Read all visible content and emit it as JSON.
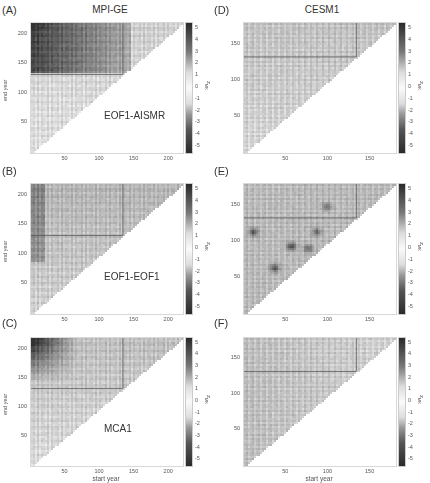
{
  "chart_data": [
    {
      "id": "A",
      "type": "heatmap",
      "panel_label": "(A)",
      "column_title": "MPI-GE",
      "annotation": "EOF1-AISMR",
      "xlabel": "",
      "ylabel": "end year",
      "xticks": [
        50,
        100,
        150,
        200
      ],
      "yticks": [
        50,
        100,
        150,
        200
      ],
      "xlim": [
        1,
        220
      ],
      "ylim": [
        1,
        220
      ],
      "colorbar_label": "z_MK",
      "colorbar_ticks": [
        5,
        4,
        3,
        2,
        1,
        0,
        -1,
        -2,
        -3,
        -4,
        -5
      ],
      "clim": [
        -6,
        6
      ],
      "shape": "upper-left triangle (end year > start year)",
      "reference_lines": {
        "x": 133,
        "y": 133
      },
      "description": "Strong dark (high |z|) region for end years > ~140 and start years < ~100"
    },
    {
      "id": "B",
      "type": "heatmap",
      "panel_label": "(B)",
      "annotation": "EOF1-EOF1",
      "xlabel": "",
      "ylabel": "end year",
      "xticks": [
        50,
        100,
        150,
        200
      ],
      "yticks": [
        50,
        100,
        150,
        200
      ],
      "xlim": [
        1,
        220
      ],
      "ylim": [
        1,
        220
      ],
      "colorbar_label": "z_MK",
      "colorbar_ticks": [
        5,
        4,
        3,
        2,
        1,
        0,
        -1,
        -2,
        -3,
        -4,
        -5
      ],
      "clim": [
        -6,
        6
      ],
      "shape": "upper-left triangle",
      "reference_lines": {
        "x": 133,
        "y": 133
      },
      "description": "Mostly light gray, moderate values near start year ~10 and end years 100-130"
    },
    {
      "id": "C",
      "type": "heatmap",
      "panel_label": "(C)",
      "annotation": "MCA1",
      "xlabel": "start year",
      "ylabel": "end year",
      "xticks": [
        50,
        100,
        150,
        200
      ],
      "yticks": [
        50,
        100,
        150,
        200
      ],
      "xlim": [
        1,
        220
      ],
      "ylim": [
        1,
        220
      ],
      "colorbar_label": "z_MK",
      "colorbar_ticks": [
        5,
        4,
        3,
        2,
        1,
        0,
        -1,
        -2,
        -3,
        -4,
        -5
      ],
      "clim": [
        -6,
        6
      ],
      "shape": "upper-left triangle",
      "reference_lines": {
        "x": 133,
        "y": 133
      },
      "description": "Dark region for end years > ~150 and start years < ~50"
    },
    {
      "id": "D",
      "type": "heatmap",
      "panel_label": "(D)",
      "column_title": "CESM1",
      "xlabel": "",
      "ylabel": "",
      "xticks": [
        50,
        100,
        150
      ],
      "yticks": [
        50,
        100,
        150
      ],
      "xlim": [
        1,
        180
      ],
      "ylim": [
        1,
        180
      ],
      "colorbar_label": "z_MK",
      "colorbar_ticks": [
        5,
        4,
        3,
        2,
        1,
        0,
        -1,
        -2,
        -3,
        -4,
        -5
      ],
      "clim": [
        -6,
        6
      ],
      "shape": "upper-left triangle",
      "reference_lines": {
        "x": 133,
        "y": 133
      },
      "description": "Mostly light, weak values throughout"
    },
    {
      "id": "E",
      "type": "heatmap",
      "panel_label": "(E)",
      "xlabel": "",
      "ylabel": "",
      "xticks": [
        50,
        100,
        150
      ],
      "yticks": [
        50,
        100,
        150
      ],
      "xlim": [
        1,
        180
      ],
      "ylim": [
        1,
        180
      ],
      "colorbar_label": "z_MK",
      "colorbar_ticks": [
        5,
        4,
        3,
        2,
        1,
        0,
        -1,
        -2,
        -3,
        -4,
        -5
      ],
      "clim": [
        -6,
        6
      ],
      "shape": "upper-left triangle",
      "reference_lines": {
        "x": 133,
        "y": 133
      },
      "description": "Medium-gray background with localized dark spots near (10,115),(55,95),(35,65),(85,115)"
    },
    {
      "id": "F",
      "type": "heatmap",
      "panel_label": "(F)",
      "xlabel": "start year",
      "ylabel": "",
      "xticks": [
        50,
        100,
        150
      ],
      "yticks": [
        50,
        100,
        150
      ],
      "xlim": [
        1,
        180
      ],
      "ylim": [
        1,
        180
      ],
      "colorbar_label": "z_MK",
      "colorbar_ticks": [
        5,
        4,
        3,
        2,
        1,
        0,
        -1,
        -2,
        -3,
        -4,
        -5
      ],
      "clim": [
        -6,
        6
      ],
      "shape": "upper-left triangle",
      "reference_lines": {
        "x": 133,
        "y": 133
      },
      "description": "Mostly light gray with faint striping"
    }
  ],
  "labels": {
    "col_left_title": "MPI-GE",
    "col_right_title": "CESM1",
    "y_axis_label": "end year",
    "x_axis_label": "start year",
    "colorbar_label": "z",
    "colorbar_sub": "MK"
  },
  "panels": [
    {
      "letter": "(A)",
      "annotation": "EOF1-AISMR",
      "xt": [
        "50",
        "100",
        "150",
        "200"
      ],
      "yt": [
        "200",
        "150",
        "100",
        "50"
      ]
    },
    {
      "letter": "(B)",
      "annotation": "EOF1-EOF1",
      "xt": [
        "50",
        "100",
        "150",
        "200"
      ],
      "yt": [
        "200",
        "150",
        "100",
        "50"
      ]
    },
    {
      "letter": "(C)",
      "annotation": "MCA1",
      "xt": [
        "50",
        "100",
        "150",
        "200"
      ],
      "yt": [
        "200",
        "150",
        "100",
        "50"
      ]
    },
    {
      "letter": "(D)",
      "annotation": "",
      "xt": [
        "50",
        "100",
        "150"
      ],
      "yt": [
        "150",
        "100",
        "50"
      ]
    },
    {
      "letter": "(E)",
      "annotation": "",
      "xt": [
        "50",
        "100",
        "150"
      ],
      "yt": [
        "150",
        "100",
        "50"
      ]
    },
    {
      "letter": "(F)",
      "annotation": "",
      "xt": [
        "50",
        "100",
        "150"
      ],
      "yt": [
        "150",
        "100",
        "50"
      ]
    }
  ],
  "cbticks": [
    "5",
    "4",
    "3",
    "2",
    "1",
    "0",
    "-1",
    "-2",
    "-3",
    "-4",
    "-5"
  ]
}
